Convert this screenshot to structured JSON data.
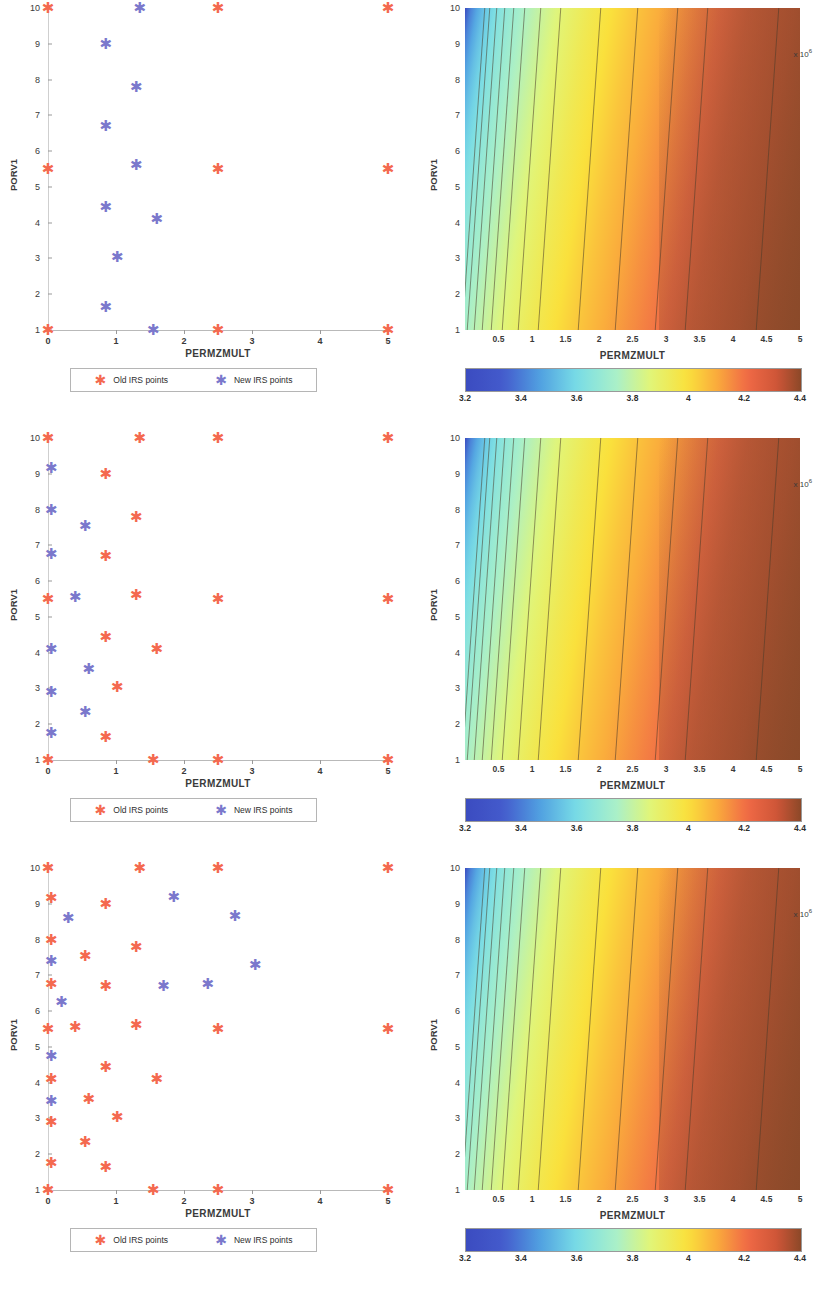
{
  "figure": {
    "panel_count": 3,
    "marker_colors": {
      "old": "#f4694f",
      "new": "#7b78cc"
    }
  },
  "scatter": {
    "xlabel": "PERMZMULT",
    "ylabel": "PORV1",
    "xticks": [
      "0",
      "1",
      "2",
      "3",
      "4",
      "5"
    ],
    "yticks": [
      "1",
      "2",
      "3",
      "4",
      "5",
      "6",
      "7",
      "8",
      "9",
      "10"
    ],
    "xlim": [
      0,
      5
    ],
    "ylim": [
      1,
      10
    ],
    "legend": {
      "old_label": "Old IRS points",
      "new_label": "New IRS points",
      "old_marker": "star-marker-old",
      "new_marker": "star-marker-new"
    }
  },
  "contour": {
    "xlabel": "PERMZMULT",
    "ylabel": "PORV1",
    "xticks": [
      "0.5",
      "1",
      "1.5",
      "2",
      "2.5",
      "3",
      "3.5",
      "4",
      "4.5",
      "5"
    ],
    "yticks": [
      "1",
      "2",
      "3",
      "4",
      "5",
      "6",
      "7",
      "8",
      "9",
      "10"
    ],
    "xlim": [
      0,
      5
    ],
    "ylim": [
      1,
      10
    ],
    "colorbar": {
      "ticks": [
        "3.2",
        "3.4",
        "3.6",
        "3.8",
        "4",
        "4.2",
        "4.4"
      ],
      "min": 3.2,
      "max": 4.4,
      "exponent": "x 10",
      "exponent_sup": "6",
      "colormap": "jet"
    }
  },
  "chart_data": [
    {
      "type": "scatter",
      "panel": 1,
      "title": "",
      "xlabel": "PERMZMULT",
      "ylabel": "PORV1",
      "xlim": [
        0,
        5
      ],
      "ylim": [
        1,
        10
      ],
      "grid": false,
      "legend_position": "below-axes",
      "series": [
        {
          "name": "Old IRS points",
          "color": "#f4694f",
          "points": [
            [
              0.0,
              10.0
            ],
            [
              2.5,
              10.0
            ],
            [
              5.0,
              10.0
            ],
            [
              0.0,
              5.5
            ],
            [
              2.5,
              5.5
            ],
            [
              5.0,
              5.5
            ],
            [
              0.0,
              1.0
            ],
            [
              2.5,
              1.0
            ],
            [
              5.0,
              1.0
            ]
          ]
        },
        {
          "name": "New IRS points",
          "color": "#7b78cc",
          "points": [
            [
              1.35,
              10.0
            ],
            [
              0.85,
              9.0
            ],
            [
              1.3,
              7.8
            ],
            [
              0.85,
              6.7
            ],
            [
              1.3,
              5.6
            ],
            [
              0.85,
              4.45
            ],
            [
              1.6,
              4.1
            ],
            [
              1.02,
              3.05
            ],
            [
              0.85,
              1.65
            ],
            [
              1.55,
              1.0
            ]
          ]
        }
      ]
    },
    {
      "type": "contour",
      "panel": 1,
      "xlabel": "PERMZMULT",
      "ylabel": "PORV1",
      "xlim": [
        0,
        5
      ],
      "ylim": [
        1,
        10
      ],
      "colormap": "jet",
      "zmin": 3.2,
      "zmax": 4.4,
      "colorbar_ticks": [
        3.2,
        3.4,
        3.6,
        3.8,
        4.0,
        4.2,
        4.4
      ],
      "contour_x_positions": [
        0.12,
        0.2,
        0.3,
        0.42,
        0.55,
        0.72,
        0.95,
        1.25,
        1.85,
        2.4,
        3.0,
        3.45,
        4.5
      ],
      "description": "Field value increases monotonically with PERMZMULT; isolines nearly vertical, fanning right at high PERMZMULT"
    },
    {
      "type": "scatter",
      "panel": 2,
      "xlabel": "PERMZMULT",
      "ylabel": "PORV1",
      "xlim": [
        0,
        5
      ],
      "ylim": [
        1,
        10
      ],
      "grid": false,
      "series": [
        {
          "name": "Old IRS points",
          "color": "#f4694f",
          "points": [
            [
              0.0,
              10.0
            ],
            [
              1.35,
              10.0
            ],
            [
              2.5,
              10.0
            ],
            [
              5.0,
              10.0
            ],
            [
              0.85,
              9.0
            ],
            [
              1.3,
              7.8
            ],
            [
              0.85,
              6.7
            ],
            [
              0.0,
              5.5
            ],
            [
              1.3,
              5.6
            ],
            [
              2.5,
              5.5
            ],
            [
              5.0,
              5.5
            ],
            [
              0.85,
              4.45
            ],
            [
              1.6,
              4.1
            ],
            [
              1.02,
              3.05
            ],
            [
              0.85,
              1.65
            ],
            [
              0.0,
              1.0
            ],
            [
              1.55,
              1.0
            ],
            [
              2.5,
              1.0
            ],
            [
              5.0,
              1.0
            ]
          ]
        },
        {
          "name": "New IRS points",
          "color": "#7b78cc",
          "points": [
            [
              0.05,
              9.15
            ],
            [
              0.05,
              8.0
            ],
            [
              0.55,
              7.55
            ],
            [
              0.05,
              6.75
            ],
            [
              0.4,
              5.55
            ],
            [
              0.05,
              4.1
            ],
            [
              0.6,
              3.55
            ],
            [
              0.05,
              2.9
            ],
            [
              0.55,
              2.35
            ],
            [
              0.05,
              1.75
            ]
          ]
        }
      ]
    },
    {
      "type": "contour",
      "panel": 2,
      "xlabel": "PERMZMULT",
      "ylabel": "PORV1",
      "xlim": [
        0,
        5
      ],
      "ylim": [
        1,
        10
      ],
      "colormap": "jet",
      "zmin": 3.2,
      "zmax": 4.4,
      "colorbar_ticks": [
        3.2,
        3.4,
        3.6,
        3.8,
        4.0,
        4.2,
        4.4
      ]
    },
    {
      "type": "scatter",
      "panel": 3,
      "xlabel": "PERMZMULT",
      "ylabel": "PORV1",
      "xlim": [
        0,
        5
      ],
      "ylim": [
        1,
        10
      ],
      "grid": false,
      "series": [
        {
          "name": "Old IRS points",
          "color": "#f4694f",
          "points": [
            [
              0.0,
              10.0
            ],
            [
              1.35,
              10.0
            ],
            [
              2.5,
              10.0
            ],
            [
              5.0,
              10.0
            ],
            [
              0.05,
              9.15
            ],
            [
              0.85,
              9.0
            ],
            [
              0.05,
              8.0
            ],
            [
              1.3,
              7.8
            ],
            [
              0.55,
              7.55
            ],
            [
              0.05,
              6.75
            ],
            [
              0.85,
              6.7
            ],
            [
              0.0,
              5.5
            ],
            [
              0.4,
              5.55
            ],
            [
              1.3,
              5.6
            ],
            [
              2.5,
              5.5
            ],
            [
              5.0,
              5.5
            ],
            [
              0.85,
              4.45
            ],
            [
              0.05,
              4.1
            ],
            [
              1.6,
              4.1
            ],
            [
              0.6,
              3.55
            ],
            [
              1.02,
              3.05
            ],
            [
              0.05,
              2.9
            ],
            [
              0.55,
              2.35
            ],
            [
              0.05,
              1.75
            ],
            [
              0.85,
              1.65
            ],
            [
              0.0,
              1.0
            ],
            [
              1.55,
              1.0
            ],
            [
              2.5,
              1.0
            ],
            [
              5.0,
              1.0
            ]
          ]
        },
        {
          "name": "New IRS points",
          "color": "#7b78cc",
          "points": [
            [
              1.85,
              9.2
            ],
            [
              0.3,
              8.6
            ],
            [
              2.75,
              8.65
            ],
            [
              0.05,
              7.4
            ],
            [
              3.05,
              7.3
            ],
            [
              1.7,
              6.7
            ],
            [
              2.35,
              6.75
            ],
            [
              0.2,
              6.25
            ],
            [
              0.05,
              4.75
            ],
            [
              0.05,
              3.5
            ]
          ]
        }
      ]
    },
    {
      "type": "contour",
      "panel": 3,
      "xlabel": "PERMZMULT",
      "ylabel": "PORV1",
      "xlim": [
        0,
        5
      ],
      "ylim": [
        1,
        10
      ],
      "colormap": "jet",
      "zmin": 3.2,
      "zmax": 4.4,
      "colorbar_ticks": [
        3.2,
        3.4,
        3.6,
        3.8,
        4.0,
        4.2,
        4.4
      ]
    }
  ]
}
